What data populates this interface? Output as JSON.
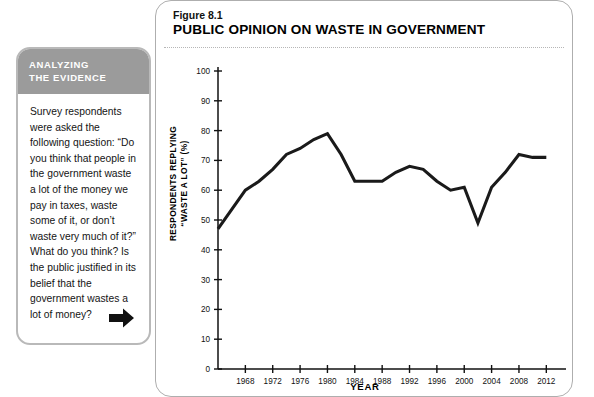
{
  "sidebar": {
    "header_line1": "ANALYZING",
    "header_line2": "THE EVIDENCE",
    "body": "Survey respondents were asked the following question: “Do you think that people in the government waste a lot of the money we pay in taxes, waste some of it, or don’t waste very much of it?” What do you think? Is the public justified in its belief that the government wastes a lot of money?",
    "arrow_icon": "arrow-right-icon",
    "header_bg": "#9b9b9b",
    "border_color": "#b9b9b9"
  },
  "figure": {
    "number": "Figure 8.1",
    "title": "PUBLIC OPINION ON WASTE IN GOVERNMENT"
  },
  "chart_data": {
    "type": "line",
    "title": "PUBLIC OPINION ON WASTE IN GOVERNMENT",
    "xlabel": "YEAR",
    "ylabel_line1": "RESPONDENTS REPLYING",
    "ylabel_line2": "“WASTE A LOT” (%)",
    "xlim": [
      1964,
      2014
    ],
    "ylim": [
      0,
      100
    ],
    "yticks": [
      0,
      10,
      20,
      30,
      40,
      50,
      60,
      70,
      80,
      90,
      100
    ],
    "xticks": [
      1968,
      1972,
      1976,
      1980,
      1984,
      1988,
      1992,
      1996,
      2000,
      2004,
      2008,
      2012
    ],
    "grid": false,
    "legend": "none",
    "line_color": "#1a1a1a",
    "line_width": 3.1,
    "x": [
      1964,
      1968,
      1970,
      1972,
      1974,
      1976,
      1978,
      1980,
      1982,
      1984,
      1986,
      1988,
      1990,
      1992,
      1994,
      1996,
      1998,
      2000,
      2002,
      2004,
      2006,
      2008,
      2010,
      2012
    ],
    "values": [
      47,
      60,
      63,
      67,
      72,
      74,
      77,
      79,
      72,
      63,
      63,
      63,
      66,
      68,
      67,
      63,
      60,
      61,
      49,
      61,
      66,
      72,
      71,
      71
    ]
  }
}
